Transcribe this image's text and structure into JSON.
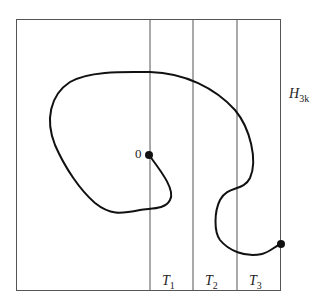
{
  "diagram": {
    "region_label": "H",
    "region_sub": "3k",
    "origin_label": "0",
    "strips": [
      {
        "label": "T",
        "sub": "1"
      },
      {
        "label": "T",
        "sub": "2"
      },
      {
        "label": "T",
        "sub": "3"
      }
    ],
    "colors": {
      "line": "#555555",
      "curve": "#111111"
    }
  }
}
